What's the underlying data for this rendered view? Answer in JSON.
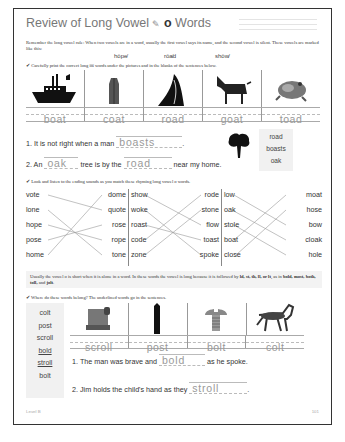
{
  "title": {
    "prefix": "Review of Long Vowel",
    "pencil_glyph": "✎",
    "vowel": "o",
    "suffix": "Words"
  },
  "intro": {
    "text_1": "Remember the long vowel rule: When two vowels are in a word, usually the first vowel says its name, and the second vowel is silent. These vowels are marked like this:",
    "examples": [
      "hōpe̸",
      "rōa̸d",
      "shōw̸"
    ]
  },
  "section1": {
    "instruction": "Carefully print the correct long o̅a̅ words under the pictures and in the blanks of the sentences below.",
    "pictures": [
      {
        "icon": "boat-icon",
        "answer": "boat"
      },
      {
        "icon": "coat-icon",
        "answer": "coat"
      },
      {
        "icon": "road-icon",
        "answer": "road"
      },
      {
        "icon": "goat-icon",
        "answer": "goat"
      },
      {
        "icon": "toad-icon",
        "answer": "toad"
      }
    ],
    "sentences": [
      {
        "number": "1.",
        "before": "It is not right when a man",
        "answer": "boasts",
        "after": "."
      },
      {
        "number": "2.",
        "before": "An",
        "answer1": "oak",
        "middle": "tree is by the",
        "answer2": "road",
        "after": "near my home."
      }
    ],
    "word_bank": [
      "road",
      "boasts",
      "oak"
    ]
  },
  "section2": {
    "instruction": "Look and listen to the ending sounds as you match these rhyming long vowel o words.",
    "groups": [
      {
        "left": [
          "vote",
          "lone",
          "hope",
          "pose",
          "home"
        ],
        "right": [
          "dome",
          "quote",
          "rose",
          "rope",
          "tone"
        ],
        "matches": [
          [
            0,
            1
          ],
          [
            1,
            4
          ],
          [
            2,
            3
          ],
          [
            3,
            2
          ],
          [
            4,
            0
          ]
        ]
      },
      {
        "left": [
          "show",
          "woke",
          "roast",
          "code",
          "zone"
        ],
        "right": [
          "rode",
          "stone",
          "flow",
          "toast",
          "spoke"
        ],
        "matches": [
          [
            0,
            2
          ],
          [
            1,
            4
          ],
          [
            2,
            3
          ],
          [
            3,
            0
          ],
          [
            4,
            1
          ]
        ]
      },
      {
        "left": [
          "low",
          "oak",
          "stole",
          "boat",
          "close"
        ],
        "right": [
          "moat",
          "hose",
          "bow",
          "cloak",
          "hole"
        ],
        "matches": [
          [
            0,
            2
          ],
          [
            1,
            3
          ],
          [
            2,
            4
          ],
          [
            3,
            0
          ],
          [
            4,
            1
          ]
        ]
      }
    ]
  },
  "section3": {
    "note_1": "Usually the vowel o is short when it is alone in a word. In these words the vowel is long because it is followed by ",
    "note_letters": "ld, st, th, ll, or lt",
    "note_2": ", as in ",
    "note_examples": "bold, most, both, toll,",
    "note_and": " and ",
    "note_last": "jolt",
    "note_end": ".",
    "instruction": "Where do these words belong? The underlined words go in the sentences.",
    "word_bank": [
      {
        "word": "colt",
        "underlined": false
      },
      {
        "word": "post",
        "underlined": false
      },
      {
        "word": "scroll",
        "underlined": false
      },
      {
        "word": "bold",
        "underlined": true
      },
      {
        "word": "stroll",
        "underlined": true
      },
      {
        "word": "bolt",
        "underlined": false
      }
    ],
    "pictures": [
      {
        "icon": "scroll-icon",
        "answer": "scroll"
      },
      {
        "icon": "post-icon",
        "answer": "post"
      },
      {
        "icon": "bolt-icon",
        "answer": "bolt"
      },
      {
        "icon": "colt-icon",
        "answer": "colt"
      }
    ],
    "sentences": [
      {
        "number": "1.",
        "before": "The man was brave and",
        "answer": "bold",
        "after": "as he spoke."
      },
      {
        "number": "2.",
        "before": "Jim holds the child's hand as they",
        "answer": "stroll",
        "after": "."
      }
    ]
  },
  "footer": {
    "level": "Level B",
    "page": "101"
  }
}
